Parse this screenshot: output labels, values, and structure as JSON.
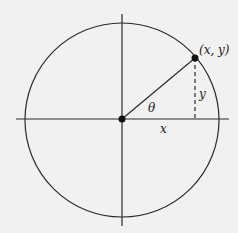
{
  "diagram": {
    "labels": {
      "point": "(x, y)",
      "angle": "θ",
      "x": "x",
      "y": "y"
    },
    "colors": {
      "background": "#f1f1f1",
      "stroke": "#2a2a2a"
    }
  }
}
